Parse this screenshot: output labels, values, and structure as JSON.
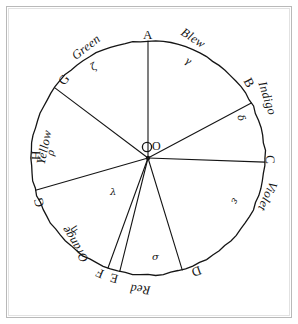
{
  "figure": {
    "centre_label": "O",
    "circle": {
      "cx": 148,
      "cy": 158,
      "r": 117
    }
  },
  "division_points": [
    {
      "id": "A",
      "label": "A",
      "angle_deg": 90,
      "label_x": 143,
      "label_y": 28,
      "rotate": 0
    },
    {
      "id": "B",
      "label": "B",
      "angle_deg": 28,
      "label_x": 245,
      "label_y": 76,
      "rotate": 62
    },
    {
      "id": "C",
      "label": "C",
      "angle_deg": 358,
      "label_x": 266,
      "label_y": 153,
      "rotate": 88
    },
    {
      "id": "D",
      "label": "D",
      "angle_deg": 287,
      "label_x": 192,
      "label_y": 265,
      "rotate": 160
    },
    {
      "id": "E",
      "label": "E",
      "angle_deg": 256,
      "label_x": 110,
      "label_y": 272,
      "rotate": 195
    },
    {
      "id": "F",
      "label": "F",
      "angle_deg": 250,
      "label_x": 96,
      "label_y": 267,
      "rotate": 202
    },
    {
      "id": "G",
      "label": "G",
      "angle_deg": 196,
      "label_x": 34,
      "label_y": 196,
      "rotate": 255
    },
    {
      "id": "H",
      "label": "H",
      "angle_deg": 176,
      "label_x": 31,
      "label_y": 149,
      "rotate": 272
    },
    {
      "id": "I",
      "label": "G",
      "angle_deg": 143,
      "label_x": 59,
      "label_y": 73,
      "rotate": 308
    }
  ],
  "colours": [
    {
      "name": "Blew",
      "label_x": 180,
      "label_y": 32,
      "rotate": 33
    },
    {
      "name": "Indigo",
      "label_x": 250,
      "label_y": 92,
      "rotate": 72
    },
    {
      "name": "Violet",
      "label_x": 252,
      "label_y": 190,
      "rotate": 114
    },
    {
      "name": "Red",
      "label_x": 130,
      "label_y": 283,
      "rotate": 186
    },
    {
      "name": "Orange",
      "label_x": 55,
      "label_y": 238,
      "rotate": 238
    },
    {
      "name": "Yellow",
      "label_x": 27,
      "label_y": 141,
      "rotate": 282
    },
    {
      "name": "Green",
      "label_x": 70,
      "label_y": 41,
      "rotate": 322
    }
  ],
  "small_marks": [
    {
      "glyph": "γ",
      "x": 185,
      "y": 56,
      "rotate": 28,
      "name": "gamma"
    },
    {
      "glyph": "δ",
      "x": 238,
      "y": 113,
      "rotate": 70,
      "name": "delta"
    },
    {
      "glyph": "ε",
      "x": 232,
      "y": 196,
      "rotate": 112,
      "name": "epsilon"
    },
    {
      "glyph": "σ",
      "x": 152,
      "y": 252,
      "rotate": 0,
      "name": "sigma"
    },
    {
      "glyph": "λ",
      "x": 110,
      "y": 187,
      "rotate": 0,
      "name": "lambda"
    },
    {
      "glyph": "η",
      "x": 71,
      "y": 225,
      "rotate": 225,
      "name": "eta"
    },
    {
      "glyph": "ρ",
      "x": 48,
      "y": 148,
      "rotate": 278,
      "name": "rho"
    },
    {
      "glyph": "ζ",
      "x": 91,
      "y": 62,
      "rotate": 330,
      "name": "zeta"
    }
  ],
  "radii": [
    {
      "from": "O",
      "to": "A",
      "angle_deg": 90
    },
    {
      "from": "O",
      "to": "B",
      "angle_deg": 28
    },
    {
      "from": "O",
      "to": "C",
      "angle_deg": 358
    },
    {
      "from": "O",
      "to": "D",
      "angle_deg": 287
    },
    {
      "from": "O",
      "to": "E",
      "angle_deg": 256
    },
    {
      "from": "O",
      "to": "F",
      "angle_deg": 250
    },
    {
      "from": "O",
      "to": "G",
      "angle_deg": 196
    },
    {
      "from": "O",
      "to": "I",
      "angle_deg": 143
    }
  ],
  "style": {
    "ink": "#151515",
    "paper": "#ffffff",
    "frame": "#b9b9b9"
  }
}
